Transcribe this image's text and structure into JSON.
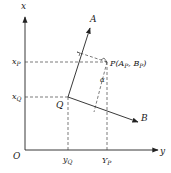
{
  "diagram": {
    "type": "coordinate-transform",
    "colors": {
      "stroke": "#222222",
      "background": "#ffffff"
    },
    "axes": {
      "vertical": {
        "label": "x"
      },
      "horizontal": {
        "label": "y"
      },
      "origin": {
        "label": "O"
      }
    },
    "points": {
      "Q": {
        "label": "Q"
      },
      "P": {
        "label": "P(A",
        "label_sub1": "P",
        "label_mid": ",  B",
        "label_sub2": "P",
        "label_end": ")"
      }
    },
    "rotated_axes": {
      "A": {
        "label": "A"
      },
      "B": {
        "label": "B"
      }
    },
    "angle": {
      "label": "α"
    },
    "ticks": {
      "xP": {
        "main": "x",
        "sub": "P"
      },
      "xQ": {
        "main": "x",
        "sub": "Q"
      },
      "yQ": {
        "main": "y",
        "sub": "Q"
      },
      "YP": {
        "main": "Y",
        "sub": "P"
      }
    }
  }
}
